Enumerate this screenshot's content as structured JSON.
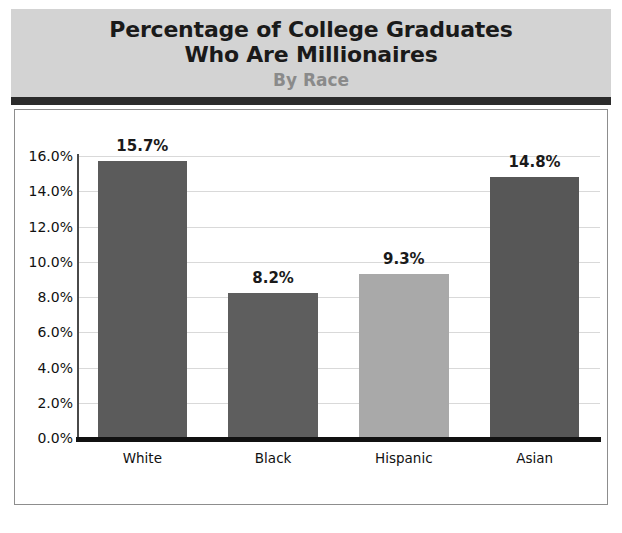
{
  "title": {
    "line1": "Percentage of College Graduates",
    "line2": "Who Are Millionaires",
    "subtitle": "By Race"
  },
  "chart_data": {
    "type": "bar",
    "title": "Percentage of College Graduates Who Are Millionaires",
    "subtitle": "By Race",
    "xlabel": "",
    "ylabel": "",
    "categories": [
      "White",
      "Black",
      "Hispanic",
      "Asian"
    ],
    "values": [
      15.7,
      8.2,
      9.3,
      14.8
    ],
    "value_labels": [
      "15.7%",
      "8.2%",
      "9.3%",
      "14.8%"
    ],
    "bar_colors": [
      "#5b5b5b",
      "#5e5e5e",
      "#a9a9a9",
      "#575757"
    ],
    "ylim": [
      0,
      16
    ],
    "ytick_values": [
      0,
      2,
      4,
      6,
      8,
      10,
      12,
      14,
      16
    ],
    "ytick_labels": [
      "0.0%",
      "2.0%",
      "4.0%",
      "6.0%",
      "8.0%",
      "10.0%",
      "12.0%",
      "14.0%",
      "16.0%"
    ],
    "grid": true,
    "legend": "none",
    "banner_color": "#d3d3d3",
    "rule_color": "#2b2b2b",
    "axis_color": "#111111"
  }
}
